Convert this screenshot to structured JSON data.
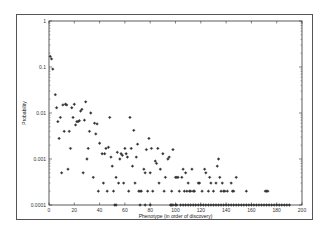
{
  "chart_data": {
    "type": "scatter",
    "title": "",
    "xlabel": "Phenotype (in order of discovery)",
    "ylabel": "Probability",
    "xlim": [
      0,
      200
    ],
    "ylim": [
      0.0001,
      1
    ],
    "yscale": "log",
    "grid": false,
    "legend": null,
    "x_ticks": [
      "0",
      "20",
      "40",
      "60",
      "80",
      "100",
      "120",
      "140",
      "160",
      "180",
      "200"
    ],
    "y_ticks": [
      "0.0001",
      "0.001",
      "0.01",
      "0.1",
      "1"
    ],
    "marker": "small open diamond",
    "series": [
      {
        "name": "phenotype probability",
        "points": [
          [
            1,
            0.17
          ],
          [
            2,
            0.15
          ],
          [
            3,
            0.09
          ],
          [
            5,
            0.025
          ],
          [
            6,
            0.013
          ],
          [
            7,
            0.0065
          ],
          [
            8,
            0.0028
          ],
          [
            9,
            0.008
          ],
          [
            10,
            0.0005
          ],
          [
            11,
            0.015
          ],
          [
            12,
            0.004
          ],
          [
            13,
            0.0155
          ],
          [
            14,
            0.015
          ],
          [
            15,
            0.0006
          ],
          [
            16,
            0.004
          ],
          [
            17,
            0.0017
          ],
          [
            18,
            0.013
          ],
          [
            19,
            0.008
          ],
          [
            20,
            0.0155
          ],
          [
            21,
            0.0055
          ],
          [
            22,
            0.0065
          ],
          [
            23,
            0.0065
          ],
          [
            24,
            0.0068
          ],
          [
            25,
            0.011
          ],
          [
            26,
            0.012
          ],
          [
            27,
            0.0005
          ],
          [
            28,
            0.007
          ],
          [
            29,
            0.0175
          ],
          [
            30,
            0.001
          ],
          [
            31,
            0.0017
          ],
          [
            32,
            0.004
          ],
          [
            33,
            0.01
          ],
          [
            35,
            0.0004
          ],
          [
            36,
            0.006
          ],
          [
            37,
            0.0035
          ],
          [
            38,
            0.0058
          ],
          [
            39,
            0.0002
          ],
          [
            40,
            0.0022
          ],
          [
            42,
            0.0013
          ],
          [
            43,
            0.0003
          ],
          [
            44,
            0.0013
          ],
          [
            45,
            0.0017
          ],
          [
            46,
            0.0002
          ],
          [
            47,
            0.0018
          ],
          [
            48,
            0.008
          ],
          [
            49,
            0.0011
          ],
          [
            50,
            0.0007
          ],
          [
            51,
            0.0002
          ],
          [
            53,
            0.0004
          ],
          [
            54,
            0.0014
          ],
          [
            55,
            0.0003
          ],
          [
            56,
            0.001
          ],
          [
            57,
            0.0013
          ],
          [
            58,
            0.0012
          ],
          [
            59,
            0.0003
          ],
          [
            60,
            0.0017
          ],
          [
            61,
            0.0013
          ],
          [
            62,
            0.0011
          ],
          [
            63,
            0.0002
          ],
          [
            64,
            0.008
          ],
          [
            65,
            0.0017
          ],
          [
            66,
            0.0007
          ],
          [
            67,
            0.0042
          ],
          [
            68,
            0.0003
          ],
          [
            69,
            0.0011
          ],
          [
            70,
            0.0021
          ],
          [
            71,
            0.0002
          ],
          [
            72,
            0.0002
          ],
          [
            73,
            0.0002
          ],
          [
            75,
            0.0006
          ],
          [
            76,
            0.0005
          ],
          [
            77,
            0.0016
          ],
          [
            78,
            0.0002
          ],
          [
            79,
            0.0028
          ],
          [
            80,
            0.0005
          ],
          [
            81,
            0.0017
          ],
          [
            82,
            0.0002
          ],
          [
            84,
            0.0009
          ],
          [
            85,
            0.0008
          ],
          [
            86,
            0.0017
          ],
          [
            87,
            0.0003
          ],
          [
            88,
            0.0006
          ],
          [
            90,
            0.0013
          ],
          [
            91,
            0.0002
          ],
          [
            92,
            0.0004
          ],
          [
            94,
            0.001
          ],
          [
            95,
            0.0011
          ],
          [
            97,
            0.0002
          ],
          [
            98,
            0.0016
          ],
          [
            100,
            0.0004
          ],
          [
            101,
            0.0004
          ],
          [
            102,
            0.0004
          ],
          [
            103,
            0.0002
          ],
          [
            105,
            0.0004
          ],
          [
            106,
            0.0006
          ],
          [
            107,
            0.0002
          ],
          [
            108,
            0.0005
          ],
          [
            109,
            0.0002
          ],
          [
            110,
            0.0003
          ],
          [
            111,
            0.0002
          ],
          [
            112,
            0.0002
          ],
          [
            113,
            0.0006
          ],
          [
            114,
            0.0002
          ],
          [
            115,
            0.0002
          ],
          [
            118,
            0.0003
          ],
          [
            119,
            0.0003
          ],
          [
            121,
            0.0002
          ],
          [
            123,
            0.0006
          ],
          [
            124,
            0.0005
          ],
          [
            126,
            0.0002
          ],
          [
            127,
            0.0004
          ],
          [
            128,
            0.0003
          ],
          [
            130,
            0.0002
          ],
          [
            132,
            0.0003
          ],
          [
            133,
            0.0007
          ],
          [
            134,
            0.001
          ],
          [
            135,
            0.0004
          ],
          [
            136,
            0.0002
          ],
          [
            137,
            0.0003
          ],
          [
            138,
            0.0002
          ],
          [
            139,
            0.0002
          ],
          [
            141,
            0.0002
          ],
          [
            144,
            0.0003
          ],
          [
            145,
            0.0002
          ],
          [
            146,
            0.0002
          ],
          [
            148,
            0.0004
          ],
          [
            156,
            0.0002
          ],
          [
            171,
            0.0002
          ],
          [
            172,
            0.0002
          ],
          [
            173,
            0.0002
          ],
          [
            52,
            0.0001
          ],
          [
            53,
            0.0001
          ],
          [
            72,
            0.0001
          ],
          [
            76,
            0.0001
          ],
          [
            80,
            0.0001
          ],
          [
            96,
            0.0001
          ],
          [
            97,
            0.0001
          ],
          [
            98,
            0.0001
          ],
          [
            100,
            0.0001
          ],
          [
            101,
            0.0001
          ],
          [
            104,
            0.0001
          ],
          [
            106,
            0.0001
          ],
          [
            108,
            0.0001
          ],
          [
            110,
            0.0001
          ],
          [
            112,
            0.0001
          ],
          [
            114,
            0.0001
          ],
          [
            116,
            0.0001
          ],
          [
            118,
            0.0001
          ],
          [
            120,
            0.0001
          ],
          [
            122,
            0.0001
          ],
          [
            124,
            0.0001
          ],
          [
            126,
            0.0001
          ],
          [
            128,
            0.0001
          ],
          [
            130,
            0.0001
          ],
          [
            132,
            0.0001
          ],
          [
            134,
            0.0001
          ],
          [
            136,
            0.0001
          ],
          [
            138,
            0.0001
          ],
          [
            140,
            0.0001
          ],
          [
            142,
            0.0001
          ],
          [
            144,
            0.0001
          ],
          [
            146,
            0.0001
          ],
          [
            148,
            0.0001
          ],
          [
            150,
            0.0001
          ],
          [
            152,
            0.0001
          ],
          [
            154,
            0.0001
          ],
          [
            156,
            0.0001
          ],
          [
            158,
            0.0001
          ],
          [
            160,
            0.0001
          ],
          [
            162,
            0.0001
          ],
          [
            164,
            0.0001
          ],
          [
            166,
            0.0001
          ],
          [
            168,
            0.0001
          ],
          [
            170,
            0.0001
          ],
          [
            172,
            0.0001
          ],
          [
            174,
            0.0001
          ],
          [
            176,
            0.0001
          ],
          [
            178,
            0.0001
          ],
          [
            180,
            0.0001
          ],
          [
            182,
            0.0001
          ],
          [
            184,
            0.0001
          ],
          [
            186,
            0.0001
          ],
          [
            188,
            0.0001
          ],
          [
            190,
            0.0001
          ]
        ]
      }
    ]
  },
  "colors": {
    "frame": "#555555",
    "axis": "#333333",
    "marker": "#333333",
    "background": "#ffffff"
  }
}
